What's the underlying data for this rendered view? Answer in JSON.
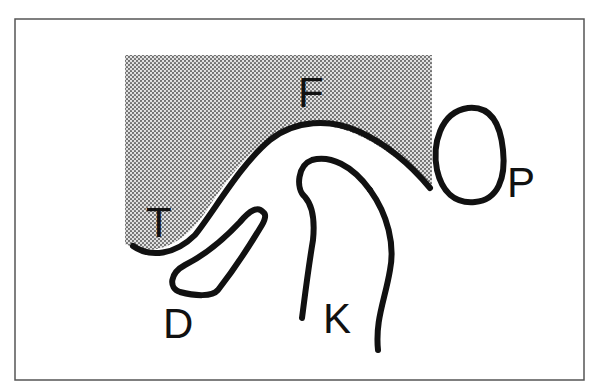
{
  "diagram": {
    "type": "anatomical line diagram",
    "labels": [
      {
        "id": "F",
        "text": "F",
        "x": 298,
        "y": 107
      },
      {
        "id": "T",
        "text": "T",
        "x": 146,
        "y": 237
      },
      {
        "id": "P",
        "text": "P",
        "x": 507,
        "y": 197
      },
      {
        "id": "D",
        "text": "D",
        "x": 163,
        "y": 338
      },
      {
        "id": "K",
        "text": "K",
        "x": 323,
        "y": 333
      }
    ],
    "colors": {
      "stroke": "#111111",
      "frame": "#555555",
      "shading_dot": "#6a6a6a",
      "background": "#ffffff"
    }
  }
}
